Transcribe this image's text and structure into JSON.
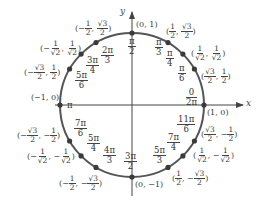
{
  "axes": {
    "x_label": "x",
    "y_label": "y"
  },
  "colors": {
    "circle": "#555555",
    "axis": "#444444",
    "point": "#3a3a3a"
  },
  "points": [
    {
      "angle_num": "0",
      "angle_num2": "2π",
      "coord": "(1, 0)"
    },
    {
      "angle_num": "π",
      "angle_den": "6",
      "coord_x_num": "√3",
      "coord_x_den": "2",
      "coord_y_num": "1",
      "coord_y_den": "2"
    },
    {
      "angle_num": "π",
      "angle_den": "4",
      "coord_x_num": "1",
      "coord_x_den": "√2",
      "coord_y_num": "1",
      "coord_y_den": "√2"
    },
    {
      "angle_num": "π",
      "angle_den": "3",
      "coord_x_num": "1",
      "coord_x_den": "2",
      "coord_y_num": "√3",
      "coord_y_den": "2"
    },
    {
      "angle_num": "π",
      "angle_den": "2",
      "coord": "(0, 1)"
    },
    {
      "angle_num": "2π",
      "angle_den": "3",
      "coord_x_num": "1",
      "coord_x_den": "2",
      "coord_y_num": "√3",
      "coord_y_den": "2",
      "x_sign": "−"
    },
    {
      "angle_num": "3π",
      "angle_den": "4",
      "coord_x_num": "1",
      "coord_x_den": "√2",
      "coord_y_num": "1",
      "coord_y_den": "√2",
      "x_sign": "−"
    },
    {
      "angle_num": "5π",
      "angle_den": "6",
      "coord_x_num": "√3",
      "coord_x_den": "2",
      "coord_y_num": "1",
      "coord_y_den": "2",
      "x_sign": "−"
    },
    {
      "angle_num": "π",
      "coord": "(−1, 0)"
    },
    {
      "angle_num": "7π",
      "angle_den": "6",
      "coord_x_num": "√3",
      "coord_x_den": "2",
      "coord_y_num": "1",
      "coord_y_den": "2",
      "x_sign": "−",
      "y_sign": "−"
    },
    {
      "angle_num": "5π",
      "angle_den": "4",
      "coord_x_num": "1",
      "coord_x_den": "√2",
      "coord_y_num": "1",
      "coord_y_den": "√2",
      "x_sign": "−",
      "y_sign": "−"
    },
    {
      "angle_num": "4π",
      "angle_den": "3",
      "coord_x_num": "1",
      "coord_x_den": "2",
      "coord_y_num": "√3",
      "coord_y_den": "2",
      "x_sign": "−",
      "y_sign": "−"
    },
    {
      "angle_num": "3π",
      "angle_den": "2",
      "coord": "(0, −1)"
    },
    {
      "angle_num": "5π",
      "angle_den": "3",
      "coord_x_num": "1",
      "coord_x_den": "2",
      "coord_y_num": "√3",
      "coord_y_den": "2",
      "y_sign": "−"
    },
    {
      "angle_num": "7π",
      "angle_den": "4",
      "coord_x_num": "1",
      "coord_x_den": "√2",
      "coord_y_num": "1",
      "coord_y_den": "√2",
      "y_sign": "−"
    },
    {
      "angle_num": "11π",
      "angle_den": "6",
      "coord_x_num": "√3",
      "coord_x_den": "2",
      "coord_y_num": "1",
      "coord_y_den": "2",
      "y_sign": "−"
    }
  ],
  "text": {
    "p0_coord": "(1, 0)",
    "p0_ang_top": "0",
    "p0_ang_bot": "2π",
    "p4_coord": "(0, 1)",
    "p8_coord": "(−1, 0)",
    "p12_coord": "(0, −1)",
    "pi": "π",
    "lp": "(",
    "rp": ")",
    "comma": ",",
    "minus": "−"
  }
}
